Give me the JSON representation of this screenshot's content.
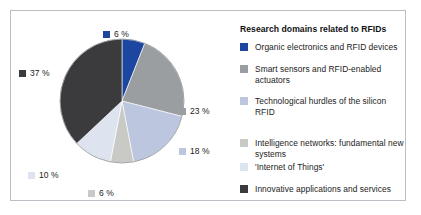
{
  "legend": {
    "title": "Research domains related to RFIDs",
    "items": [
      {
        "label": "Organic electronics and RFID devices",
        "color": "#1d46a0",
        "swatch_name": "legend-swatch-organic-electronics"
      },
      {
        "label": "Smart sensors and RFID-enabled actuators",
        "color": "#9a9ea1",
        "swatch_name": "legend-swatch-smart-sensors"
      },
      {
        "label": "Technological hurdles of the silicon RFID",
        "color": "#bcc6de",
        "swatch_name": "legend-swatch-technological-hurdles"
      },
      {
        "label": "Intelligence networks: fundamental new systems",
        "color": "#c9cac6",
        "swatch_name": "legend-swatch-intelligence-networks"
      },
      {
        "label": "'Internet of Things'",
        "color": "#dde4f0",
        "swatch_name": "legend-swatch-internet-of-things"
      },
      {
        "label": "Innovative applications and services",
        "color": "#3b3b3d",
        "swatch_name": "legend-swatch-innovative-applications"
      }
    ]
  },
  "pie_labels": {
    "blue": "6 %",
    "midgray": "23 %",
    "bluegray": "18 %",
    "warmgray": "6 %",
    "paleblue": "10 %",
    "darkgray": "37 %"
  },
  "chart_data": {
    "type": "pie",
    "title": "Research domains related to RFIDs",
    "xlabel": "",
    "ylabel": "",
    "legend_position": "right",
    "grid": false,
    "units": "percent",
    "start_angle_deg": 0,
    "direction": "clockwise",
    "categories": [
      "Organic electronics and RFID devices",
      "Smart sensors and RFID-enabled actuators",
      "Technological hurdles of the silicon RFID",
      "Intelligence networks: fundamental new systems",
      "'Internet of Things'",
      "Innovative applications and services"
    ],
    "values": [
      6,
      23,
      18,
      6,
      10,
      37
    ],
    "data_labels": [
      "6 %",
      "23 %",
      "18 %",
      "6 %",
      "10 %",
      "37 %"
    ],
    "colors": [
      "#1d46a0",
      "#9a9ea1",
      "#bcc6de",
      "#c9cac6",
      "#dde4f0",
      "#3b3b3d"
    ],
    "total": 100
  },
  "frame": {
    "border_color": "#b9bec4",
    "background": "#ffffff"
  }
}
